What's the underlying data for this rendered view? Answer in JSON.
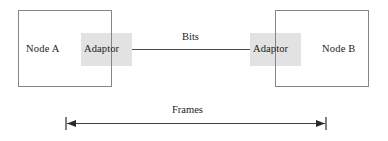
{
  "diagram": {
    "nodes": [
      {
        "id": "node-a",
        "label": "Node A"
      },
      {
        "id": "node-b",
        "label": "Node B"
      }
    ],
    "adaptors": [
      {
        "id": "adaptor-left",
        "label": "Adaptor"
      },
      {
        "id": "adaptor-right",
        "label": "Adaptor"
      }
    ],
    "link": {
      "label": "Bits"
    },
    "span": {
      "label": "Frames"
    },
    "colors": {
      "background": "#ffffff",
      "node_border": "#85868a",
      "node_fill": "#ffffff",
      "adaptor_fill": "#e2e2e2",
      "link_line": "#4a4a4f",
      "text": "#1c1c1c",
      "arrow": "#2b2b2b"
    }
  }
}
